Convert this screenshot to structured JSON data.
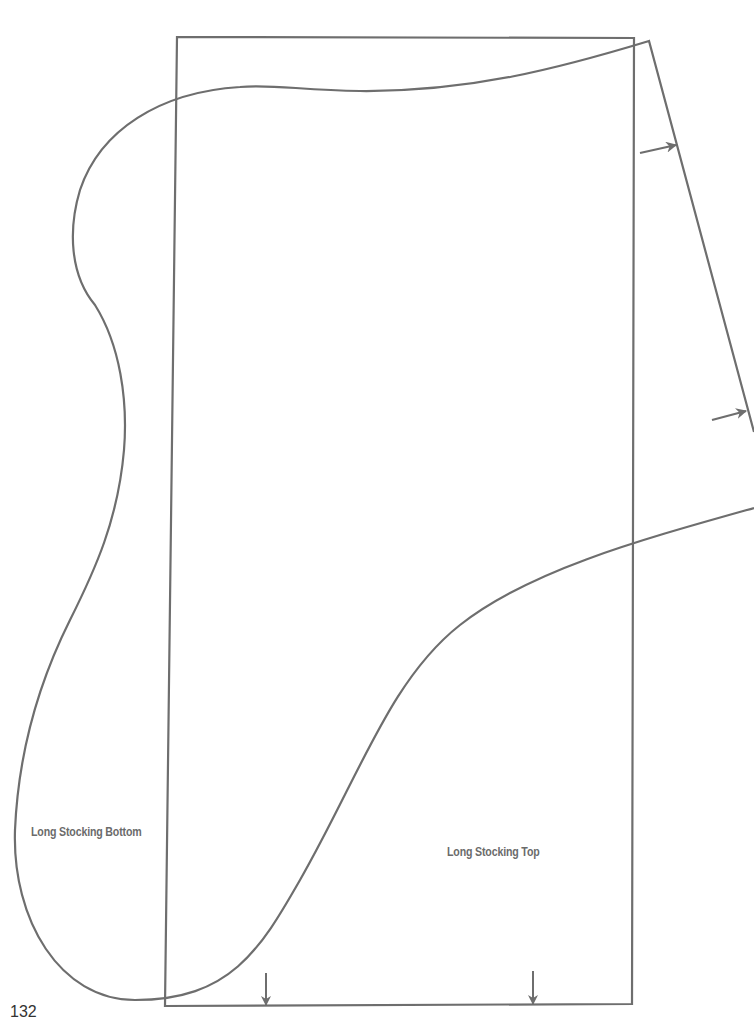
{
  "page": {
    "number": "132",
    "background": "#ffffff"
  },
  "pattern": {
    "line_color": "#6e6e6e",
    "pieces": [
      {
        "id": "bottom",
        "label": "Long Stocking Bottom"
      },
      {
        "id": "top",
        "label": "Long Stocking Top"
      }
    ],
    "markers": [
      {
        "type": "arrow-right",
        "description": "grain/placement arrow on right slanted edge (upper)"
      },
      {
        "type": "arrow-right",
        "description": "grain/placement arrow on right slanted edge (lower)"
      },
      {
        "type": "arrow-down",
        "description": "fold/placement arrow on bottom edge (left)"
      },
      {
        "type": "arrow-down",
        "description": "fold/placement arrow on bottom edge (right)"
      }
    ]
  }
}
